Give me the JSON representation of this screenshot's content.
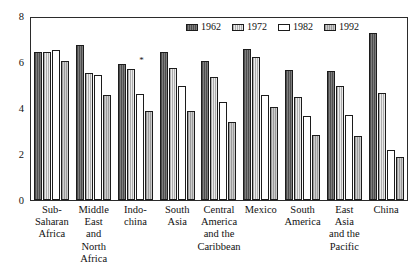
{
  "chart_data": {
    "type": "bar",
    "title": "",
    "xlabel": "",
    "ylabel": "",
    "ylim": [
      0,
      8
    ],
    "yticks": [
      0,
      2,
      4,
      6,
      8
    ],
    "grid": false,
    "legend_position": "top-right-inside",
    "categories": [
      "Sub-Saharan Africa",
      "Middle East and North Africa",
      "Indochina",
      "South Asia",
      "Central America and the Caribbean",
      "Mexico",
      "South America",
      "East Asia and the Pacific",
      "China"
    ],
    "category_label_lines": [
      [
        "Sub-",
        "Saharan",
        "Africa"
      ],
      [
        "Middle",
        "East",
        "and",
        "North",
        "Africa"
      ],
      [
        "Indo-",
        "china"
      ],
      [
        "South",
        "Asia"
      ],
      [
        "Central",
        "America",
        "and the",
        "Caribbean"
      ],
      [
        "Mexico"
      ],
      [
        "South",
        "America"
      ],
      [
        "East",
        "Asia",
        "and the",
        "Pacific"
      ],
      [
        "China"
      ]
    ],
    "series": [
      {
        "name": "1962",
        "color": "#6f6f6f",
        "values": [
          6.5,
          6.8,
          6.0,
          6.5,
          6.1,
          6.65,
          5.7,
          5.65,
          7.35
        ]
      },
      {
        "name": "1972",
        "color": "#d2d2d2",
        "values": [
          6.5,
          5.6,
          5.75,
          5.8,
          5.4,
          6.3,
          4.55,
          5.0,
          4.7
        ]
      },
      {
        "name": "1982",
        "color": "#ffffff",
        "values": [
          6.6,
          5.5,
          4.65,
          5.0,
          4.3,
          4.6,
          3.7,
          3.75,
          2.2
        ]
      },
      {
        "name": "1992",
        "color": "#b2b2b2",
        "values": [
          6.1,
          4.6,
          3.9,
          3.9,
          3.45,
          4.1,
          2.85,
          2.8,
          1.9
        ]
      }
    ],
    "annotations": [
      {
        "text": "*",
        "category": "Indochina",
        "value": 6.35
      }
    ]
  },
  "legend": {
    "items": [
      {
        "label": "1962",
        "swatch": "dark-gray-hatched"
      },
      {
        "label": "1972",
        "swatch": "light-gray-stipple"
      },
      {
        "label": "1982",
        "swatch": "white"
      },
      {
        "label": "1992",
        "swatch": "medium-gray"
      }
    ]
  },
  "axis": {
    "y_tick_labels": [
      "8",
      "6",
      "4",
      "2",
      "0"
    ]
  }
}
